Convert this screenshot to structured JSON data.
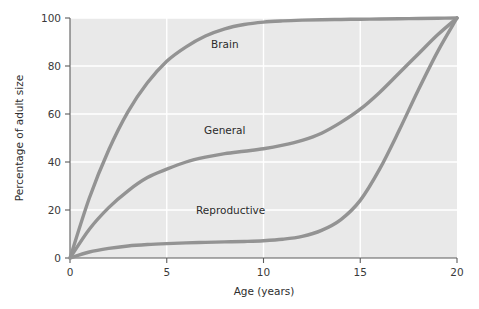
{
  "chart_data": {
    "type": "line",
    "title": "",
    "xlabel": "Age (years)",
    "ylabel": "Percentage of adult size",
    "xlim": [
      0,
      20
    ],
    "ylim": [
      0,
      100
    ],
    "xticks": [
      0,
      5,
      10,
      15,
      20
    ],
    "xtick_labels": [
      "0",
      "5",
      "10",
      "15",
      "20"
    ],
    "yticks": [
      0,
      20,
      40,
      60,
      80,
      100
    ],
    "ytick_labels": [
      "0",
      "20",
      "40",
      "60",
      "80",
      "100"
    ],
    "grid": true,
    "grid_color": "#ffffff",
    "plot_background": "#e9e9e9",
    "line_color": "#939393",
    "legend": "inline-labels",
    "x": [
      0,
      1,
      2,
      3,
      4,
      5,
      6,
      7,
      8,
      9,
      10,
      11,
      12,
      13,
      14,
      15,
      16,
      17,
      18,
      19,
      20
    ],
    "series": [
      {
        "name": "Brain",
        "label": "Brain",
        "label_x": 8.0,
        "label_y": 89,
        "values": [
          0,
          25,
          45,
          61,
          73,
          82,
          88,
          92.5,
          95.5,
          97.3,
          98.3,
          98.8,
          99.1,
          99.3,
          99.4,
          99.5,
          99.6,
          99.7,
          99.8,
          99.9,
          100
        ]
      },
      {
        "name": "General",
        "label": "General",
        "label_x": 8.0,
        "label_y": 53,
        "values": [
          0,
          12,
          21,
          28,
          33.5,
          37,
          40,
          42,
          43.5,
          44.5,
          45.5,
          47,
          49,
          52,
          56.5,
          62,
          69,
          77,
          85,
          93,
          100
        ]
      },
      {
        "name": "Reproductive",
        "label": "Reproductive",
        "label_x": 8.3,
        "label_y": 20,
        "values": [
          0,
          2.5,
          4,
          5,
          5.6,
          6,
          6.3,
          6.5,
          6.7,
          6.9,
          7.2,
          7.8,
          9,
          11.5,
          16,
          24,
          37,
          53,
          70,
          86,
          100
        ]
      }
    ]
  }
}
